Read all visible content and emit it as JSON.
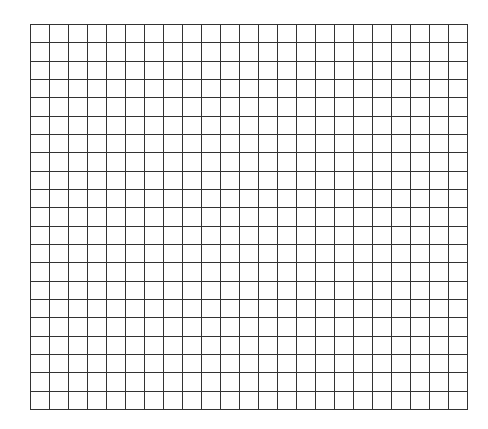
{
  "grid": {
    "columns": 23,
    "rows": 21,
    "left": 30,
    "top": 24,
    "right": 467,
    "bottom": 409,
    "line_color": "#333333",
    "line_width": 1,
    "background": "#ffffff"
  }
}
